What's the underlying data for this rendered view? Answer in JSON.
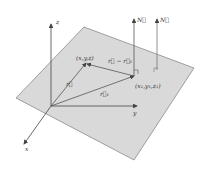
{
  "diagram": {
    "type": "3d-plane-vector-geometry",
    "colors": {
      "plane_fill": "#d9d9d9",
      "plane_stroke": "#8a8a8a",
      "line": "#444444",
      "text": "#333333"
    },
    "axes": {
      "z_label": "z",
      "y_label": "y",
      "x_label": "x"
    },
    "points": {
      "p": "(x,y,z)",
      "p1": "(x₁,y₁,z₁)"
    },
    "vectors": {
      "r": "r⃗",
      "r1": "r⃗₁",
      "diff": "r⃗ − r⃗₁",
      "normal1": "N⃗",
      "normal2": "N⃗"
    }
  }
}
